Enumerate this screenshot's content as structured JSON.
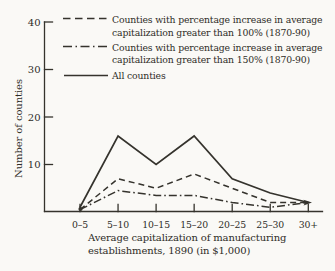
{
  "figure": {
    "ylabel": "Number of counties",
    "xlabel_line1": "Average capitalization of manufacturing",
    "xlabel_line2": "establishments, 1890 (in $1,000)"
  },
  "legend": {
    "items": [
      {
        "style": "dashed",
        "lines": [
          "Counties with percentage increase in average",
          "capitalization greater than 100% (1870-90)"
        ]
      },
      {
        "style": "dashdot",
        "lines": [
          "Counties with percentage increase in average",
          "capitalization greater than 150% (1870-90)"
        ]
      },
      {
        "style": "solid",
        "lines": [
          "All counties"
        ]
      }
    ]
  },
  "chart_data": {
    "type": "line",
    "categories": [
      "0–5",
      "5–10",
      "10–15",
      "15–20",
      "20–25",
      "25–30",
      "30+"
    ],
    "series": [
      {
        "name": "Counties with percentage increase in average capitalization greater than 100% (1870-90)",
        "line_style": "dashed",
        "values": [
          0.5,
          7,
          5,
          8,
          5,
          2,
          2
        ]
      },
      {
        "name": "Counties with percentage increase in average capitalization greater than 150% (1870-90)",
        "line_style": "dashdot",
        "values": [
          0.5,
          4.5,
          3.5,
          3.5,
          2,
          1,
          2
        ]
      },
      {
        "name": "All counties",
        "line_style": "solid",
        "values": [
          1,
          16,
          10,
          16,
          7,
          4,
          2
        ]
      }
    ],
    "title": "",
    "xlabel": "Average capitalization of manufacturing establishments, 1890 (in $1,000)",
    "ylabel": "Number of counties",
    "yticks": [
      10,
      20,
      30,
      40
    ],
    "ylim": [
      0,
      40
    ],
    "grid": false,
    "legend_position": "top-left",
    "ink_color": "#35332d",
    "background_color": "#faf9f6"
  }
}
